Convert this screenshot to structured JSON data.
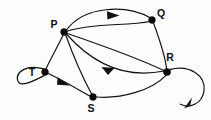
{
  "figure": {
    "kind": "directed-graph",
    "background_color": "#fdfdfd",
    "stroke_color": "#111111",
    "node_color": "#0a0a0a",
    "width": 211,
    "height": 120
  },
  "nodes": [
    {
      "id": "P",
      "label": "P",
      "x": 64,
      "y": 32,
      "label_x": 54,
      "label_y": 28,
      "radius": 3.4
    },
    {
      "id": "Q",
      "label": "Q",
      "x": 152,
      "y": 20,
      "label_x": 161,
      "label_y": 17,
      "radius": 3.4
    },
    {
      "id": "R",
      "label": "R",
      "x": 167,
      "y": 72,
      "label_x": 170,
      "label_y": 61,
      "radius": 3.6
    },
    {
      "id": "S",
      "label": "S",
      "x": 93,
      "y": 97,
      "label_x": 91,
      "label_y": 112,
      "radius": 3.4
    },
    {
      "id": "T",
      "label": "T",
      "x": 45,
      "y": 72,
      "label_x": 32,
      "label_y": 76,
      "radius": 3.4
    }
  ],
  "self_loops": [
    {
      "id": "loop-T",
      "node": "T",
      "side": "left",
      "has_arrow": false
    },
    {
      "id": "loop-R",
      "node": "R",
      "side": "right",
      "has_arrow": true
    }
  ],
  "edges": [
    {
      "id": "edge-P-Q-upper",
      "from": "P",
      "to": "Q",
      "directed": true,
      "arrow_position": "middle",
      "arrow_direction": "right"
    },
    {
      "id": "edge-P-Q-lower",
      "from": "P",
      "to": "Q",
      "directed": false,
      "arrow_position": "none",
      "arrow_direction": "none"
    },
    {
      "id": "edge-Q-R",
      "from": "Q",
      "to": "R",
      "directed": false,
      "arrow_position": "none",
      "arrow_direction": "none"
    },
    {
      "id": "edge-P-R-upper",
      "from": "P",
      "to": "R",
      "directed": false,
      "arrow_position": "none",
      "arrow_direction": "none"
    },
    {
      "id": "edge-R-P-lower",
      "from": "R",
      "to": "P",
      "directed": true,
      "arrow_position": "middle",
      "arrow_direction": "left"
    },
    {
      "id": "edge-P-S",
      "from": "P",
      "to": "S",
      "directed": false,
      "arrow_position": "none",
      "arrow_direction": "none"
    },
    {
      "id": "edge-P-T",
      "from": "P",
      "to": "T",
      "directed": false,
      "arrow_position": "none",
      "arrow_direction": "none"
    },
    {
      "id": "edge-T-S",
      "from": "T",
      "to": "S",
      "directed": true,
      "arrow_position": "middle",
      "arrow_direction": "down-right"
    },
    {
      "id": "edge-S-R",
      "from": "S",
      "to": "R",
      "directed": false,
      "arrow_position": "none",
      "arrow_direction": "none"
    }
  ],
  "labels": {
    "P": "P",
    "Q": "Q",
    "R": "R",
    "S": "S",
    "T": "T"
  }
}
